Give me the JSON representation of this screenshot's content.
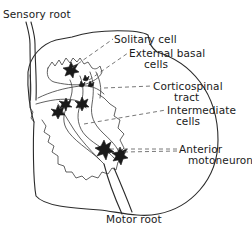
{
  "figure": {
    "type": "spinal cord cross-section line drawing",
    "colors": {
      "ink": "#1a1a1a",
      "background": "#ffffff",
      "leader_lines": "#555555"
    }
  },
  "labels": {
    "sensory_root": "Sensory root",
    "solitary_cell": "Solitary cell",
    "external_basal": {
      "line1": "External basal",
      "line2": "cells"
    },
    "corticospinal": {
      "line1": "Corticospinal",
      "line2": "tract"
    },
    "intermediate": {
      "line1": "Intermediate",
      "line2": "cells"
    },
    "anterior": {
      "line1": "Anterior",
      "line2": "motoneurons"
    },
    "motor_root": "Motor root"
  },
  "structures": [
    {
      "name": "sensory-root",
      "position": "top-left"
    },
    {
      "name": "solitary-cell",
      "position": "dorsal horn"
    },
    {
      "name": "external-basal-cells",
      "position": "base of dorsal horn"
    },
    {
      "name": "corticospinal-tract",
      "position": "lateral white matter"
    },
    {
      "name": "intermediate-cells",
      "position": "intermediate zone"
    },
    {
      "name": "anterior-motoneurons",
      "position": "ventral horn"
    },
    {
      "name": "motor-root",
      "position": "bottom"
    }
  ]
}
